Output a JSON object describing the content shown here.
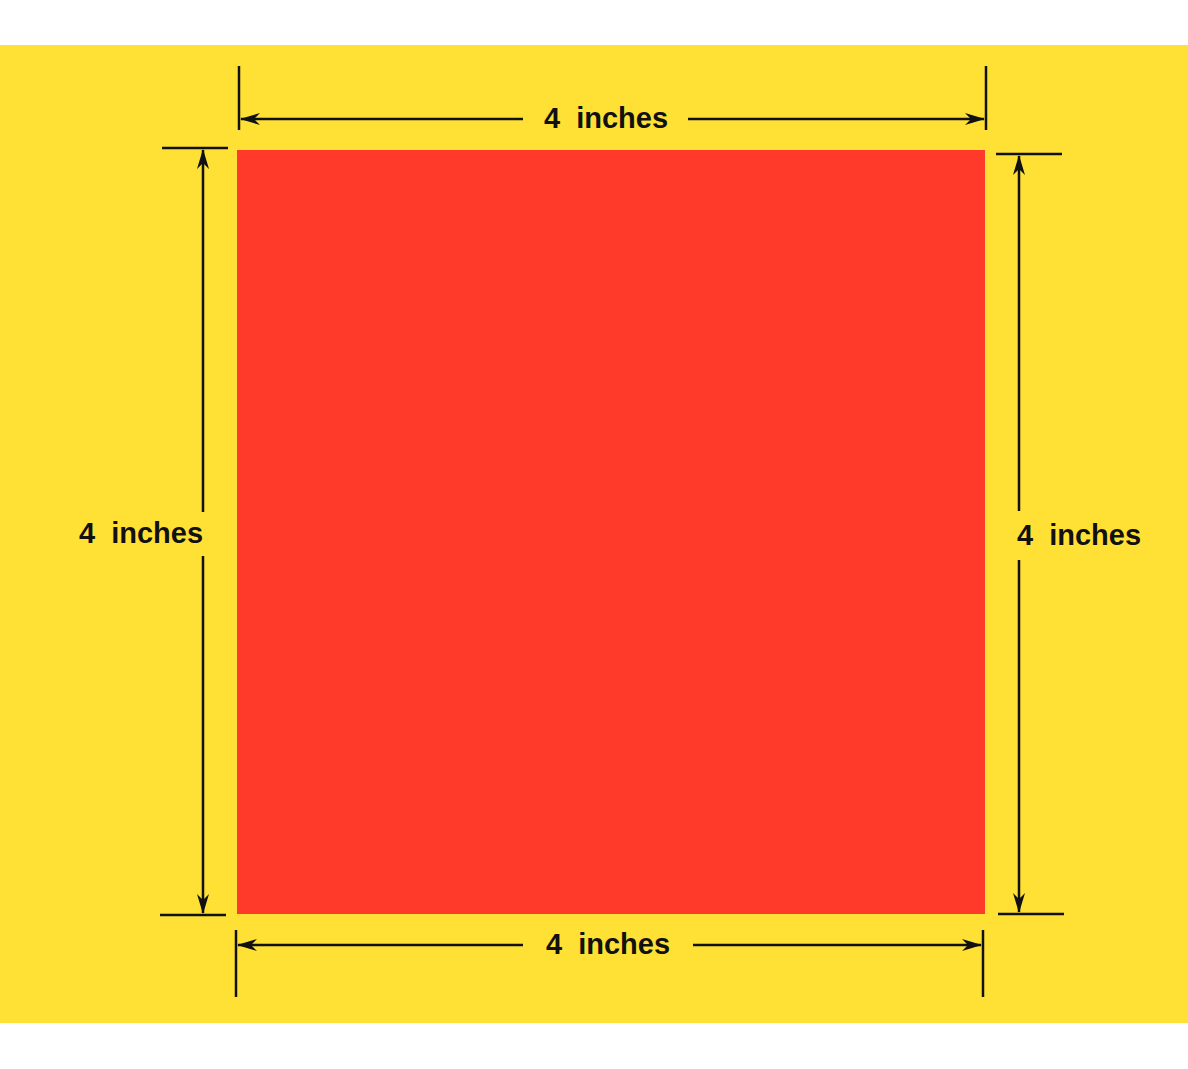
{
  "diagram": {
    "type": "dimensioned-square",
    "colors": {
      "background": "#FFE135",
      "square": "#FF3A2A",
      "lines": "#111111",
      "page": "#FFFFFF"
    },
    "shape": "square",
    "labels": {
      "top": "4  inches",
      "bottom": "4  inches",
      "left": "4  inches",
      "right": "4  inches"
    }
  }
}
